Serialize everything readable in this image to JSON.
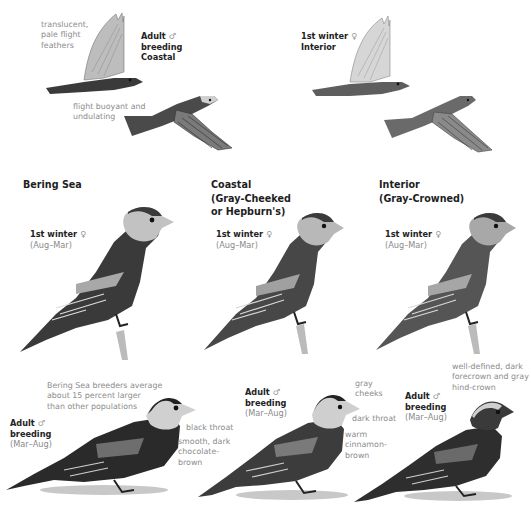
{
  "plate": {
    "flight": {
      "coastal_adult_male": {
        "label_line1": "Adult",
        "sex_symbol": "♂",
        "label_line2": "breeding",
        "label_line3": "Coastal",
        "note_wings": [
          "translucent,",
          "pale flight",
          "feathers"
        ],
        "note_flight": [
          "flight buoyant and",
          "undulating"
        ]
      },
      "interior_first_winter_female": {
        "label_line1": "1st winter",
        "sex_symbol": "♀",
        "label_line2": "Interior"
      }
    },
    "columns": [
      {
        "header": [
          "Bering Sea"
        ],
        "first_winter": {
          "label": "1st winter",
          "sex_symbol": "♀",
          "season": "(Aug–Mar)"
        },
        "adult": {
          "label_line1": "Adult",
          "sex_symbol": "♂",
          "label_line2": "breeding",
          "season": "(Mar–Aug)",
          "notes": {
            "size": [
              "Bering Sea breeders average",
              "about 15 percent larger",
              "than other populations"
            ],
            "throat": [
              "black throat"
            ],
            "body": [
              "smooth, dark",
              "chocolate-",
              "brown"
            ]
          }
        }
      },
      {
        "header": [
          "Coastal",
          "(Gray-Cheeked",
          "or Hepburn's)"
        ],
        "first_winter": {
          "label": "1st winter",
          "sex_symbol": "♀",
          "season": "(Aug–Mar)"
        },
        "adult": {
          "label_line1": "Adult",
          "sex_symbol": "♂",
          "label_line2": "breeding",
          "season": "(Mar–Aug)",
          "notes": {
            "cheeks": [
              "gray",
              "cheeks"
            ],
            "throat": [
              "dark throat"
            ],
            "body": [
              "warm",
              "cinnamon-",
              "brown"
            ]
          }
        }
      },
      {
        "header": [
          "Interior",
          "(Gray-Crowned)"
        ],
        "first_winter": {
          "label": "1st winter",
          "sex_symbol": "♀",
          "season": "(Aug–Mar)"
        },
        "adult": {
          "label_line1": "Adult",
          "sex_symbol": "♂",
          "label_line2": "breeding",
          "season": "(Mar–Aug)",
          "notes": {
            "crown": [
              "well-defined, dark",
              "forecrown and gray",
              "hind-crown"
            ]
          }
        }
      }
    ]
  },
  "colors": {
    "label_dark": "#222222",
    "note_gray": "#8c8c8c",
    "bird_dark": "#2b2b2b",
    "bird_mid": "#5a5a5a",
    "bird_light": "#c8c8c8"
  }
}
